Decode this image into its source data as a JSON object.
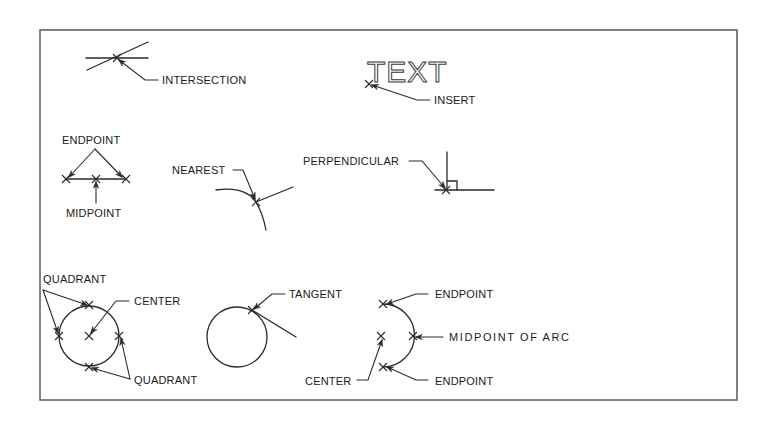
{
  "diagram": {
    "frame_color": "#5a5a5a",
    "line_color": "#2a2a2a",
    "labels": {
      "intersection": "INTERSECTION",
      "insert_text": "TEXT",
      "insert": "INSERT",
      "endpoint_line": "ENDPOINT",
      "midpoint_line": "MIDPOINT",
      "nearest": "NEAREST",
      "perpendicular": "PERPENDICULAR",
      "quadrant_top": "QUADRANT",
      "center_circle": "CENTER",
      "quadrant_bottom": "QUADRANT",
      "tangent": "TANGENT",
      "endpoint_arc_top": "ENDPOINT",
      "midpoint_arc": "MIDPOINT OF ARC",
      "center_arc": "CENTER",
      "endpoint_arc_bottom": "ENDPOINT"
    }
  }
}
